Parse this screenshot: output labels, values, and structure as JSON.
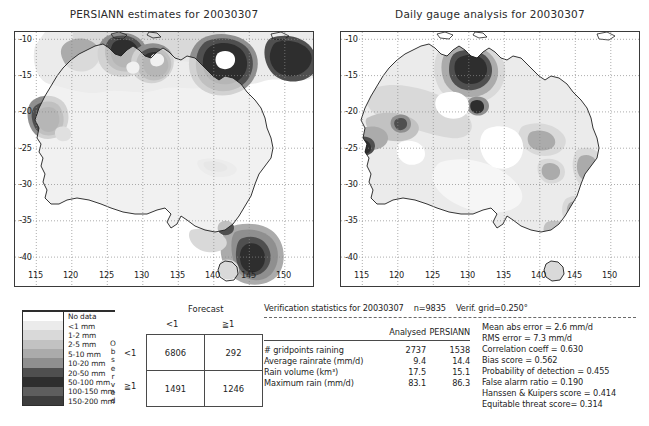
{
  "figure": {
    "panels": [
      {
        "title": "PERSIANN estimates for 20030307"
      },
      {
        "title": "Daily gauge analysis for 20030307"
      }
    ],
    "axes": {
      "lon_ticks": [
        "115",
        "120",
        "125",
        "130",
        "135",
        "140",
        "145",
        "150"
      ],
      "lat_ticks": [
        "-10",
        "-15",
        "-20",
        "-25",
        "-30",
        "-35",
        "-40"
      ],
      "lon_range": [
        112,
        154
      ],
      "lat_range": [
        -44,
        -9
      ]
    }
  },
  "legend": {
    "title": "",
    "vertical_label": "Observed",
    "items": [
      {
        "label": "No data",
        "color": "#ffffff"
      },
      {
        "label": "<1 mm",
        "color": "#ebebeb"
      },
      {
        "label": "1-2 mm",
        "color": "#d9d9d9"
      },
      {
        "label": "2-5 mm",
        "color": "#c2c2c2"
      },
      {
        "label": "5-10 mm",
        "color": "#ababab"
      },
      {
        "label": "10-20 mm",
        "color": "#8f8f8f"
      },
      {
        "label": "20-50 mm",
        "color": "#4f4f4f"
      },
      {
        "label": "50-100 mm",
        "color": "#2e2e2e"
      },
      {
        "label": "100-150 mm",
        "color": "#5e5e5e"
      },
      {
        "label": "150-200 mm",
        "color": "#3d3d3d"
      }
    ]
  },
  "contingency": {
    "top_header": "Forecast",
    "side_header": "Observed",
    "col_labels": [
      "<1",
      "≧1"
    ],
    "row_labels": [
      "<1",
      "≧1"
    ],
    "cells": [
      [
        "6806",
        "292"
      ],
      [
        "1491",
        "1246"
      ]
    ]
  },
  "verification": {
    "heading": "Verification statistics for 20030307",
    "n_label": "n=9835",
    "grid_label": "Verif. grid=0.250°",
    "col_headers": [
      "Analysed",
      "PERSIANN"
    ],
    "rows": [
      {
        "name": "# gridpoints raining",
        "analysed": "2737",
        "persiann": "1538"
      },
      {
        "name": "Average rainrate (mm/d)",
        "analysed": "9.4",
        "persiann": "14.4"
      },
      {
        "name": "Rain volume (km³)",
        "analysed": "17.5",
        "persiann": "15.1"
      },
      {
        "name": "Maximum rain (mm/d)",
        "analysed": "83.1",
        "persiann": "86.3"
      }
    ],
    "scores": [
      "Mean abs error = 2.6 mm/d",
      "RMS error = 7.3 mm/d",
      "Correlation coeff = 0.630",
      "Bias score = 0.562",
      "Probability of detection = 0.455",
      "False alarm ratio = 0.190",
      "Hanssen & Kuipers score = 0.414",
      "Equitable threat score= 0.314"
    ]
  }
}
